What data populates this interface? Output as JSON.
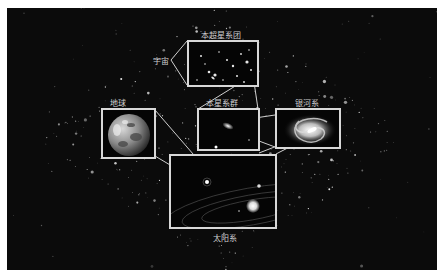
{
  "diagram": {
    "labels": {
      "universe": "宇宙",
      "supercluster": "本超星系团",
      "local_group": "本星系群",
      "milky_way": "银河系",
      "earth": "地球",
      "solar_system": "太阳系"
    },
    "colors": {
      "background": "#0b0b0b",
      "frame_border": "#ffffff",
      "box_border": "#d8d8d8",
      "label_text": "#d0d0d0"
    }
  }
}
